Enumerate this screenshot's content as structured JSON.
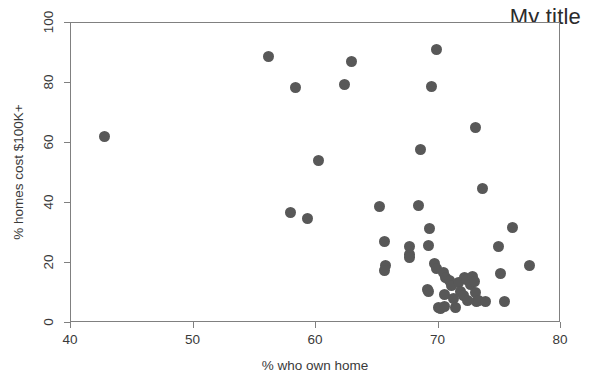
{
  "chart_data": {
    "type": "scatter",
    "title": "My title",
    "xlabel": "% who own home",
    "ylabel": "% homes cost $100K+",
    "xlim": [
      40,
      80
    ],
    "ylim": [
      0,
      100
    ],
    "xticks": [
      40,
      50,
      60,
      70,
      80
    ],
    "yticks": [
      0,
      20,
      40,
      60,
      80,
      100
    ],
    "grid": false,
    "legend": null,
    "marker": {
      "shape": "circle",
      "color": "#585858",
      "size_px": 11
    },
    "series": [
      {
        "name": "states",
        "points": [
          {
            "x": 42.7,
            "y": 62.2
          },
          {
            "x": 56.1,
            "y": 88.9
          },
          {
            "x": 58.3,
            "y": 78.6
          },
          {
            "x": 57.9,
            "y": 36.8
          },
          {
            "x": 59.3,
            "y": 34.8
          },
          {
            "x": 60.2,
            "y": 54.2
          },
          {
            "x": 62.3,
            "y": 79.4
          },
          {
            "x": 62.9,
            "y": 87.2
          },
          {
            "x": 65.2,
            "y": 38.8
          },
          {
            "x": 65.6,
            "y": 27.3
          },
          {
            "x": 65.7,
            "y": 19.2
          },
          {
            "x": 65.6,
            "y": 17.6
          },
          {
            "x": 67.6,
            "y": 25.4
          },
          {
            "x": 67.6,
            "y": 22.8
          },
          {
            "x": 67.6,
            "y": 21.9
          },
          {
            "x": 68.4,
            "y": 39.2
          },
          {
            "x": 68.5,
            "y": 57.8
          },
          {
            "x": 69.4,
            "y": 79.0
          },
          {
            "x": 69.8,
            "y": 91.2
          },
          {
            "x": 69.3,
            "y": 31.5
          },
          {
            "x": 69.2,
            "y": 25.8
          },
          {
            "x": 69.1,
            "y": 11.2
          },
          {
            "x": 69.2,
            "y": 10.4
          },
          {
            "x": 69.7,
            "y": 19.9
          },
          {
            "x": 69.8,
            "y": 18.3
          },
          {
            "x": 70.0,
            "y": 5.2
          },
          {
            "x": 70.2,
            "y": 4.8
          },
          {
            "x": 70.5,
            "y": 5.4
          },
          {
            "x": 70.4,
            "y": 16.8
          },
          {
            "x": 70.6,
            "y": 15.2
          },
          {
            "x": 70.5,
            "y": 9.6
          },
          {
            "x": 70.9,
            "y": 14.2
          },
          {
            "x": 71.1,
            "y": 12.4
          },
          {
            "x": 71.2,
            "y": 8.2
          },
          {
            "x": 71.4,
            "y": 5.3
          },
          {
            "x": 71.6,
            "y": 13.4
          },
          {
            "x": 71.8,
            "y": 10.6
          },
          {
            "x": 72.0,
            "y": 9.3
          },
          {
            "x": 72.1,
            "y": 15.3
          },
          {
            "x": 72.3,
            "y": 14.4
          },
          {
            "x": 72.4,
            "y": 7.6
          },
          {
            "x": 72.6,
            "y": 12.8
          },
          {
            "x": 72.8,
            "y": 15.6
          },
          {
            "x": 72.9,
            "y": 14.0
          },
          {
            "x": 73.0,
            "y": 10.2
          },
          {
            "x": 73.1,
            "y": 7.2
          },
          {
            "x": 73.3,
            "y": 7.5
          },
          {
            "x": 73.0,
            "y": 65.2
          },
          {
            "x": 73.6,
            "y": 44.8
          },
          {
            "x": 73.8,
            "y": 7.3
          },
          {
            "x": 74.9,
            "y": 25.6
          },
          {
            "x": 75.1,
            "y": 16.4
          },
          {
            "x": 75.4,
            "y": 7.2
          },
          {
            "x": 76.0,
            "y": 31.8
          },
          {
            "x": 77.4,
            "y": 19.2
          }
        ]
      }
    ]
  },
  "axes": {
    "x_tick_labels": [
      "40",
      "50",
      "60",
      "70",
      "80"
    ],
    "y_tick_labels": [
      "0",
      "20",
      "40",
      "60",
      "80",
      "100"
    ]
  }
}
